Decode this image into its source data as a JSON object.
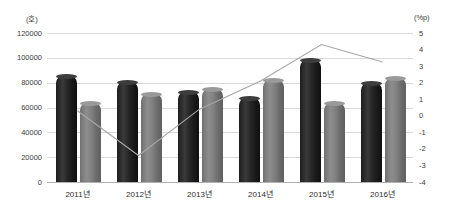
{
  "chart_data": {
    "type": "bar",
    "title": "",
    "subtitle": "",
    "xlabel": "",
    "ylabel": "(호)",
    "y2label": "(%p)",
    "grid": true,
    "legend_position": "none",
    "categories": [
      "2011년",
      "2012년",
      "2013년",
      "2014년",
      "2015년",
      "2016년"
    ],
    "ylim": [
      0,
      120000
    ],
    "yticks": [
      "0",
      "20000",
      "40000",
      "60000",
      "80000",
      "100000",
      "120000"
    ],
    "ytick_values": [
      0,
      20000,
      40000,
      60000,
      80000,
      100000,
      120000
    ],
    "y2lim": [
      -4,
      5
    ],
    "y2ticks": [
      "-4",
      "-3",
      "-2",
      "-1",
      "0",
      "1",
      "2",
      "3",
      "4",
      "5"
    ],
    "y2tick_values": [
      -4,
      -3,
      -2,
      -1,
      0,
      1,
      2,
      3,
      4,
      5
    ],
    "series": [
      {
        "name": "series-1-bar-dark",
        "type": "bar",
        "axis": "left",
        "color": "#262626",
        "values": [
          85500,
          80500,
          72500,
          67500,
          98500,
          79500
        ]
      },
      {
        "name": "series-2-bar-light",
        "type": "bar",
        "axis": "left",
        "color": "#808080",
        "values": [
          64000,
          70500,
          75000,
          82000,
          63500,
          83500
        ]
      },
      {
        "name": "series-3-line",
        "type": "line",
        "axis": "right",
        "color": "#a6a6a6",
        "values": [
          0.3,
          -2.4,
          0.4,
          2.1,
          4.3,
          3.25
        ]
      }
    ]
  },
  "colors": {
    "bar_dark": "#262626",
    "bar_light": "#808080",
    "line": "#a6a6a6",
    "gridline": "#d9d9d9",
    "baseline": "#b0b0b0",
    "text": "#3a3a3a",
    "background": "#ffffff"
  }
}
